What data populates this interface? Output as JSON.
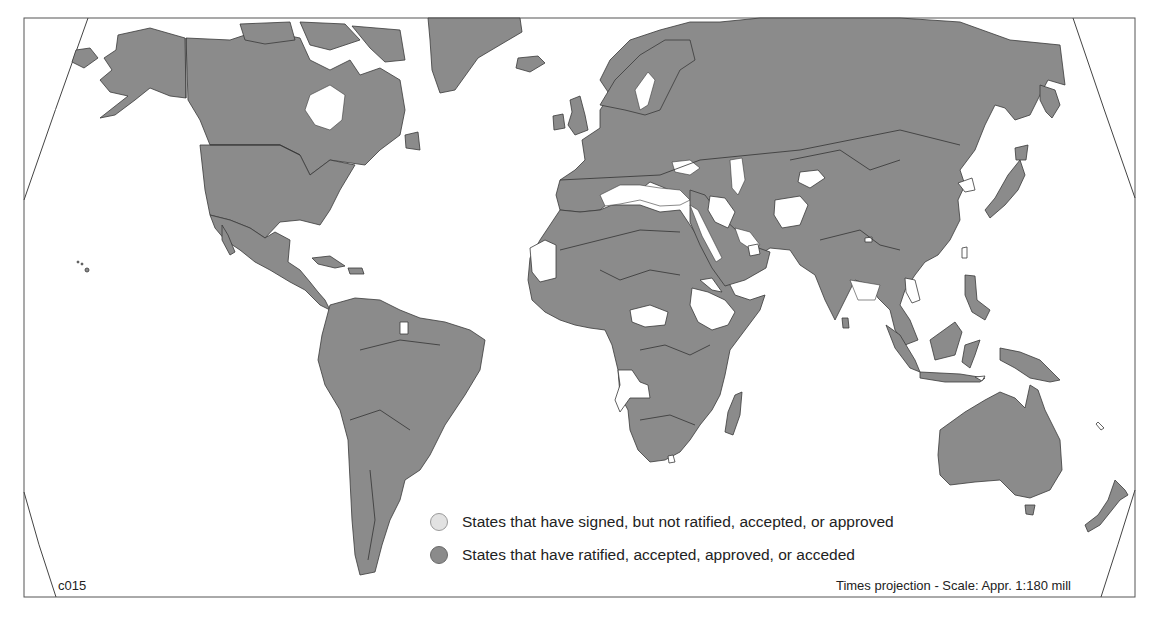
{
  "map": {
    "id_label": "c015",
    "projection_label": "Times projection - Scale: Appr. 1:180 mill",
    "colors": {
      "ratified": "#8b8b8b",
      "signed_only": "#ffffff",
      "border": "#3a3a3a",
      "background": "#ffffff"
    }
  },
  "legend": {
    "items": [
      {
        "label": "States that have signed, but not ratified, accepted, or approved",
        "swatch_color": "#e2e2e2"
      },
      {
        "label": "States that have ratified, accepted, approved, or acceded",
        "swatch_color": "#8b8b8b"
      }
    ]
  },
  "regions": {
    "signed_only": [
      "Mauritania",
      "Central African Republic",
      "Ethiopia",
      "Eritrea",
      "Angola",
      "Lesotho",
      "Iraq",
      "Afghanistan",
      "Kyrgyzstan",
      "United Arab Emirates",
      "North Korea",
      "Taiwan",
      "Thailand",
      "Bhutan",
      "Suriname",
      "East Timor",
      "New Caledonia"
    ]
  }
}
